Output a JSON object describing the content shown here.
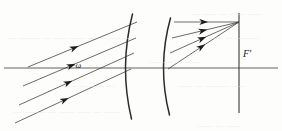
{
  "figure": {
    "kind": "optical-ray-diagram",
    "width": 282,
    "height": 131,
    "background_color": "#fdfdfc",
    "ink_color": "#2b2b2b",
    "bleed_color": "#e8e6e0"
  },
  "labels": {
    "field_angle": "−ω",
    "rear_focal_point": "F'"
  },
  "optical_axis": {
    "name": "optical-axis",
    "y": 68,
    "x_start": 4,
    "x_end": 278,
    "color": "#3a3a3a"
  },
  "focal_plane": {
    "name": "rear-focal-plane",
    "x": 239,
    "y_top": 13,
    "y_bottom": 113,
    "color": "#3a3a3a"
  },
  "lens_surfaces": [
    {
      "name": "first-principal-surface",
      "x_vertex": 130,
      "y_top": 14,
      "y_bottom": 119,
      "bulge": 11
    },
    {
      "name": "second-principal-surface",
      "x_vertex": 168,
      "y_top": 18,
      "y_bottom": 115,
      "bulge": 11
    }
  ],
  "incident_rays": {
    "name": "incident-parallel-bundle",
    "count": 4,
    "direction": "down-left to up-right",
    "arrow_fraction": 0.46,
    "segments": [
      {
        "x1": 28,
        "y1": 67,
        "x2": 137,
        "y2": 22
      },
      {
        "x1": 23,
        "y1": 86,
        "x2": 136,
        "y2": 38
      },
      {
        "x1": 19,
        "y1": 105,
        "x2": 134,
        "y2": 53
      },
      {
        "x1": 15,
        "y1": 123,
        "x2": 131,
        "y2": 69
      }
    ]
  },
  "refracted_rays": {
    "name": "refracted-converging-bundle",
    "count": 4,
    "converge_at": {
      "x": 239,
      "y": 22
    },
    "arrow_fraction": 0.52,
    "segments": [
      {
        "x1": 174,
        "y1": 22,
        "x2": 239,
        "y2": 22
      },
      {
        "x1": 172,
        "y1": 38,
        "x2": 239,
        "y2": 22
      },
      {
        "x1": 170,
        "y1": 53,
        "x2": 239,
        "y2": 22
      },
      {
        "x1": 168,
        "y1": 69,
        "x2": 239,
        "y2": 22
      }
    ]
  },
  "bleed_through": {
    "note": "faint show-through text from reverse of scanned page",
    "lines": [
      {
        "text": "— —— — —— ——",
        "x": 192,
        "y": 10
      },
      {
        "text": "— ——— — —— —— — ——— —",
        "x": 8,
        "y": 34
      },
      {
        "text": "—— — ———",
        "x": 208,
        "y": 34
      },
      {
        "text": "——— — ——",
        "x": 150,
        "y": 58
      },
      {
        "text": "— —— —— —",
        "x": 62,
        "y": 82
      },
      {
        "text": "—— — ——— ——",
        "x": 178,
        "y": 82
      },
      {
        "text": "— ——— — —— —— — ——",
        "x": 14,
        "y": 108
      },
      {
        "text": "—— — ——",
        "x": 198,
        "y": 122
      }
    ]
  }
}
